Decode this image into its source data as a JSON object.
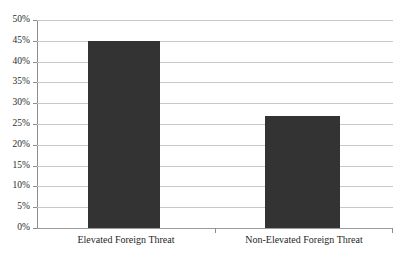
{
  "chart_data": {
    "type": "bar",
    "title": "",
    "subtitle": "",
    "xlabel": "",
    "ylabel": "",
    "categories": [
      "Elevated Foreign Threat",
      "Non-Elevated Foreign Threat"
    ],
    "values": [
      45,
      27
    ],
    "value_labels": [
      "45%",
      "27%"
    ],
    "ylim": [
      0,
      50
    ],
    "ytick_step": 5,
    "ytick_labels": [
      "0%",
      "5%",
      "10%",
      "15%",
      "20%",
      "25%",
      "30%",
      "35%",
      "40%",
      "45%",
      "50%"
    ],
    "ytick_values": [
      0,
      5,
      10,
      15,
      20,
      25,
      30,
      35,
      40,
      45,
      50
    ],
    "grid": true,
    "grid_axis": "y",
    "legend": false,
    "legend_position": "none",
    "series": [
      {
        "name": "",
        "values": [
          45,
          27
        ]
      }
    ],
    "colors": {
      "bar_fill": "#333333",
      "gridline": "#c8c8c8",
      "axis_line": "#8d8d8d",
      "background": "#ffffff",
      "text": "#1f1f1f"
    }
  }
}
